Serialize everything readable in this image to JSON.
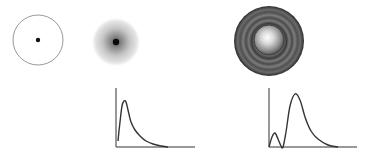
{
  "figure": {
    "width": 366,
    "height": 158,
    "background": "#ffffff"
  },
  "panels": [
    {
      "id": "empty-orbit",
      "shape": "circle-with-center-dot",
      "center": [
        38,
        40
      ],
      "radius": 25,
      "stroke": "#9a9a9a",
      "dot_radius": 2.2,
      "dot_color": "#111111"
    },
    {
      "id": "diffuse-cloud",
      "shape": "radial-fuzzy-cloud",
      "center": [
        116,
        42
      ],
      "radius": 25,
      "dot_radius": 3.2,
      "dot_color": "#0a0a0a",
      "cloud_inner_color": "#7a7a7a",
      "cloud_outer_color": "#ececec"
    },
    {
      "id": "shell-sphere",
      "shape": "concentric-shells",
      "center": [
        269,
        41
      ],
      "outer_radius": 35,
      "inner_radius": 15,
      "outer_colors": [
        "#2e2e2e",
        "#6a6a6a",
        "#3a3a3a",
        "#707070",
        "#444444"
      ],
      "inner_highlight": "#f4f4f4",
      "inner_edge": "#3c3c3c"
    }
  ],
  "chart_data": [
    {
      "type": "line",
      "title": "",
      "xlabel": "",
      "ylabel": "",
      "grid": false,
      "description": "Single-peak radial probability distribution (skewed right)",
      "axes": {
        "origin": [
          116,
          147
        ],
        "y_top": 88,
        "x_end": 195
      },
      "x": [
        0,
        2,
        4,
        6,
        8,
        10,
        13,
        17,
        22,
        28,
        35,
        43,
        50
      ],
      "values": [
        0.15,
        0.6,
        0.92,
        1.0,
        0.95,
        0.8,
        0.6,
        0.42,
        0.27,
        0.15,
        0.07,
        0.02,
        0.0
      ],
      "points_px": [
        [
          118,
          141
        ],
        [
          120,
          122
        ],
        [
          122,
          106
        ],
        [
          124,
          101
        ],
        [
          126,
          102
        ],
        [
          128,
          110
        ],
        [
          131,
          122
        ],
        [
          135,
          130
        ],
        [
          140,
          136
        ],
        [
          146,
          141
        ],
        [
          153,
          144
        ],
        [
          161,
          146
        ],
        [
          168,
          147
        ]
      ]
    },
    {
      "type": "line",
      "title": "",
      "xlabel": "",
      "ylabel": "",
      "grid": false,
      "description": "Double-peak radial probability distribution: small inner lobe then large outer peak",
      "axes": {
        "origin": [
          269,
          147
        ],
        "y_top": 88,
        "x_end": 357
      },
      "x": [
        0,
        3,
        6,
        9,
        12,
        14,
        17,
        20,
        24,
        28,
        32,
        38,
        45,
        55,
        65
      ],
      "values": [
        0.0,
        0.2,
        0.27,
        0.15,
        0.02,
        0.0,
        0.25,
        0.75,
        1.0,
        0.88,
        0.55,
        0.3,
        0.14,
        0.04,
        0.0
      ],
      "points_px": [
        [
          269,
          147
        ],
        [
          272,
          137
        ],
        [
          275,
          133
        ],
        [
          278,
          139
        ],
        [
          281,
          146
        ],
        [
          283,
          147
        ],
        [
          286,
          132
        ],
        [
          290,
          106
        ],
        [
          295,
          94
        ],
        [
          300,
          100
        ],
        [
          305,
          117
        ],
        [
          311,
          131
        ],
        [
          318,
          139
        ],
        [
          328,
          145
        ],
        [
          338,
          147
        ]
      ]
    }
  ]
}
